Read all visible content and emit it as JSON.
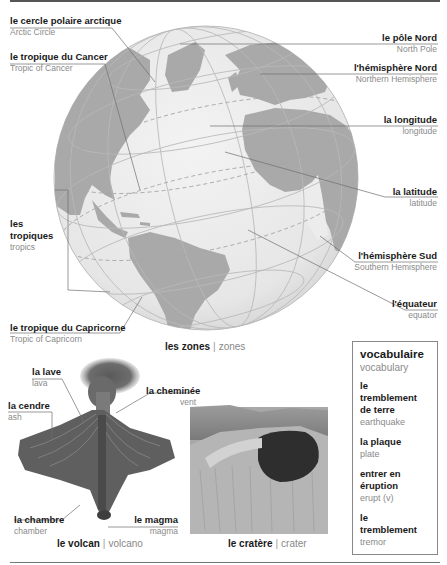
{
  "globe": {
    "labels": [
      {
        "fr": "le cercle polaire arctique",
        "en": "Arctic Circle"
      },
      {
        "fr": "le tropique du Cancer",
        "en": "Tropic of Cancer"
      },
      {
        "fr": "les tropiques",
        "en": "tropics"
      },
      {
        "fr": "le tropique du Capricorne",
        "en": "Tropic of Capricorn"
      },
      {
        "fr": "le pôle Nord",
        "en": "North Pole"
      },
      {
        "fr": "l'hémisphère Nord",
        "en": "Northern Hemisphere"
      },
      {
        "fr": "la longitude",
        "en": "longitude"
      },
      {
        "fr": "la latitude",
        "en": "latitude"
      },
      {
        "fr": "l'hémisphère Sud",
        "en": "Southern Hemisphere"
      },
      {
        "fr": "l'équateur",
        "en": "equator"
      }
    ],
    "tropiques_line1": "les",
    "tropiques_line2": "tropiques",
    "caption": {
      "fr": "les zones",
      "sep": "|",
      "en": "zones"
    }
  },
  "volcano": {
    "labels": [
      {
        "fr": "la lave",
        "en": "lava"
      },
      {
        "fr": "la cendre",
        "en": "ash"
      },
      {
        "fr": "la cheminée",
        "en": "vent"
      },
      {
        "fr": "la chambre",
        "en": "chamber"
      },
      {
        "fr": "le magma",
        "en": "magma"
      }
    ],
    "caption": {
      "fr": "le volcan",
      "sep": "|",
      "en": "volcano"
    }
  },
  "crater": {
    "caption": {
      "fr": "le cratère",
      "sep": "|",
      "en": "crater"
    }
  },
  "vocabulary": {
    "title": "vocabulaire",
    "title_en": "vocabulary",
    "items": [
      {
        "fr_lines": [
          "le",
          "tremblement",
          "de terre"
        ],
        "en": "earthquake"
      },
      {
        "fr_lines": [
          "la plaque"
        ],
        "en": "plate"
      },
      {
        "fr_lines": [
          "entrer en",
          "éruption"
        ],
        "en": "erupt (v)"
      },
      {
        "fr_lines": [
          "le",
          "tremblement"
        ],
        "en": "tremor"
      }
    ]
  },
  "colors": {
    "land": "#a9a9a9",
    "ocean": "#ececec",
    "grid": "#b8b8b8",
    "leader": "#6f6f6f",
    "text_en": "#8a8a8a"
  }
}
